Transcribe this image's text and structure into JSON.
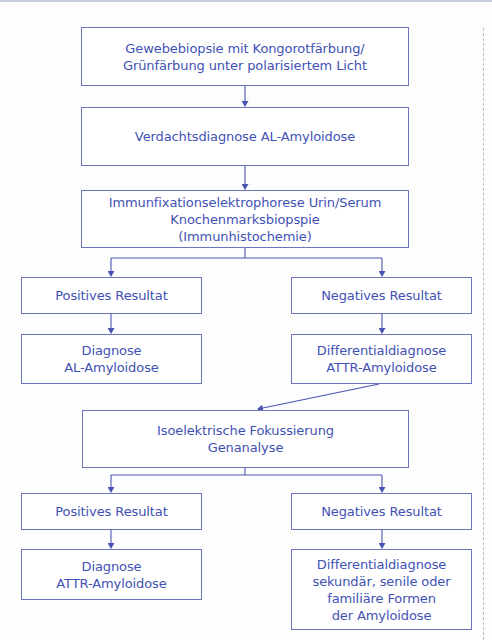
{
  "diagram": {
    "colors": {
      "text": "#3f52b4",
      "border": "#6c74bb",
      "line": "#4a55b0"
    },
    "nodes": {
      "biopsy": {
        "lines": [
          "Gewebebiopsie mit Kongorotfärbung/",
          "Grünfärbung unter polarisiertem Licht"
        ]
      },
      "suspicion": {
        "lines": [
          "Verdachtsdiagnose AL-Amyloidose"
        ]
      },
      "immunofixation": {
        "lines": [
          "Immunfixationselektrophorese Urin/Serum",
          "Knochenmarksbiopspie",
          "(Immunhistochemie)"
        ]
      },
      "positive1": {
        "lines": [
          "Positives Resultat"
        ]
      },
      "negative1": {
        "lines": [
          "Negatives Resultat"
        ]
      },
      "diagnosis_al": {
        "lines": [
          "Diagnose",
          "AL-Amyloidose"
        ]
      },
      "differential_attr": {
        "lines": [
          "Differentialdiagnose",
          "ATTR-Amyloidose"
        ]
      },
      "isoelectric": {
        "lines": [
          "Isoelektrische Fokussierung",
          "Genanalyse"
        ]
      },
      "positive2": {
        "lines": [
          "Positives Resultat"
        ]
      },
      "negative2": {
        "lines": [
          "Negatives Resultat"
        ]
      },
      "diagnosis_attr": {
        "lines": [
          "Diagnose",
          "ATTR-Amyloidose"
        ]
      },
      "differential_other": {
        "lines": [
          "Differentialdiagnose",
          "sekundär, senile oder",
          "familiäre Formen",
          "der Amyloidose"
        ]
      }
    }
  }
}
